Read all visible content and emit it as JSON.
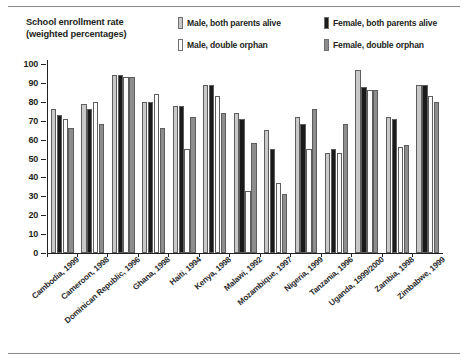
{
  "chart_data": {
    "type": "bar",
    "title": "School enrollment rate (weighted percentages)",
    "title_line1": "School enrollment rate",
    "title_line2": "(weighted percentages)",
    "xlabel": "",
    "ylabel": "",
    "ylim": [
      0,
      100
    ],
    "yticks": [
      0,
      10,
      20,
      30,
      40,
      50,
      60,
      70,
      80,
      90,
      100
    ],
    "grid": false,
    "legend_position": "top-right",
    "categories": [
      "Cambodia, 1999",
      "Cameroon, 1998",
      "Dominican Republic, 1996",
      "Ghana, 1998",
      "Haiti, 1994",
      "Kenya, 1998",
      "Malawi, 1992",
      "Mozambique, 1997",
      "Nigeria, 1999",
      "Tanzania, 1996",
      "Uganda, 1999/2000",
      "Zambia, 1998",
      "Zimbabwe, 1999"
    ],
    "series": [
      {
        "name": "Male, both parents alive",
        "color": "#c9c9c9",
        "values": [
          76,
          79,
          94,
          80,
          78,
          89,
          74,
          65,
          72,
          53,
          97,
          72,
          89
        ]
      },
      {
        "name": "Female, both parents alive",
        "color": "#1a1a1a",
        "values": [
          73,
          76,
          94,
          80,
          78,
          89,
          71,
          55,
          68,
          55,
          88,
          71,
          89
        ]
      },
      {
        "name": "Male, double orphan",
        "color": "#fbfbfb",
        "values": [
          71,
          80,
          93,
          84,
          55,
          83,
          33,
          37,
          55,
          53,
          86,
          56,
          83
        ]
      },
      {
        "name": "Female, double orphan",
        "color": "#8d8d8d",
        "values": [
          66,
          68,
          93,
          66,
          72,
          74,
          58,
          31,
          76,
          68,
          86,
          57,
          80
        ]
      }
    ]
  },
  "legend": {
    "items": [
      {
        "label": "Male, both parents alive",
        "swatch": "#c9c9c9",
        "icon": "legend-swatch-male-both"
      },
      {
        "label": "Male, double orphan",
        "swatch": "#fbfbfb",
        "icon": "legend-swatch-male-orphan"
      },
      {
        "label": "Female, both parents alive",
        "swatch": "#1a1a1a",
        "icon": "legend-swatch-female-both"
      },
      {
        "label": "Female, double orphan",
        "swatch": "#8d8d8d",
        "icon": "legend-swatch-female-orphan"
      }
    ]
  }
}
